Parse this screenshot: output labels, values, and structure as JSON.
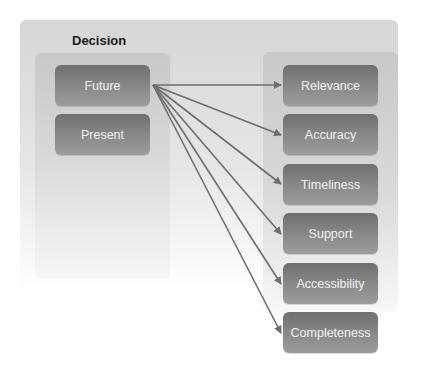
{
  "diagram": {
    "left_group": {
      "title": "Decision",
      "items": [
        {
          "label": "Future"
        },
        {
          "label": "Present"
        }
      ]
    },
    "right_group": {
      "items": [
        {
          "label": "Relevance"
        },
        {
          "label": "Accuracy"
        },
        {
          "label": "Timeliness"
        },
        {
          "label": "Support"
        },
        {
          "label": "Accessibility"
        },
        {
          "label": "Completeness"
        }
      ]
    },
    "connections": [
      {
        "from": "Future",
        "to": "Relevance"
      },
      {
        "from": "Future",
        "to": "Accuracy"
      },
      {
        "from": "Future",
        "to": "Timeliness"
      },
      {
        "from": "Future",
        "to": "Support"
      },
      {
        "from": "Future",
        "to": "Accessibility"
      },
      {
        "from": "Future",
        "to": "Completeness"
      }
    ],
    "colors": {
      "box_fill": "#808080",
      "box_text": "#f2f2f2",
      "arrow": "#6e6e6e",
      "panel": "#d6d6d6"
    }
  }
}
